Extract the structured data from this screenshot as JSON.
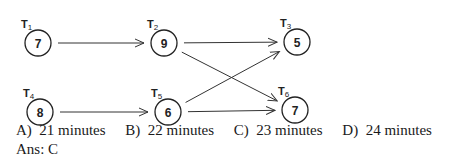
{
  "diagram": {
    "nodes": [
      {
        "id": "T1",
        "label": "T",
        "sub": "1",
        "value": "7",
        "cx": 38,
        "cy": 43
      },
      {
        "id": "T2",
        "label": "T",
        "sub": "2",
        "value": "9",
        "cx": 164,
        "cy": 43
      },
      {
        "id": "T3",
        "label": "T",
        "sub": "3",
        "value": "5",
        "cx": 297,
        "cy": 42
      },
      {
        "id": "T4",
        "label": "T",
        "sub": "4",
        "value": "8",
        "cx": 40,
        "cy": 112
      },
      {
        "id": "T5",
        "label": "T",
        "sub": "5",
        "value": "6",
        "cx": 168,
        "cy": 112
      },
      {
        "id": "T6",
        "label": "T",
        "sub": "6",
        "value": "7",
        "cx": 295,
        "cy": 110
      }
    ],
    "edges": [
      {
        "from": "T1",
        "to": "T2"
      },
      {
        "from": "T2",
        "to": "T3"
      },
      {
        "from": "T2",
        "to": "T6"
      },
      {
        "from": "T4",
        "to": "T5"
      },
      {
        "from": "T5",
        "to": "T3"
      },
      {
        "from": "T5",
        "to": "T6"
      }
    ]
  },
  "question": {
    "options": [
      {
        "letter": "A)",
        "text": "21 minutes"
      },
      {
        "letter": "B)",
        "text": "22 minutes"
      },
      {
        "letter": "C)",
        "text": "23 minutes"
      },
      {
        "letter": "D)",
        "text": "24 minutes"
      }
    ],
    "answer_label": "Ans:",
    "answer_value": "C"
  }
}
